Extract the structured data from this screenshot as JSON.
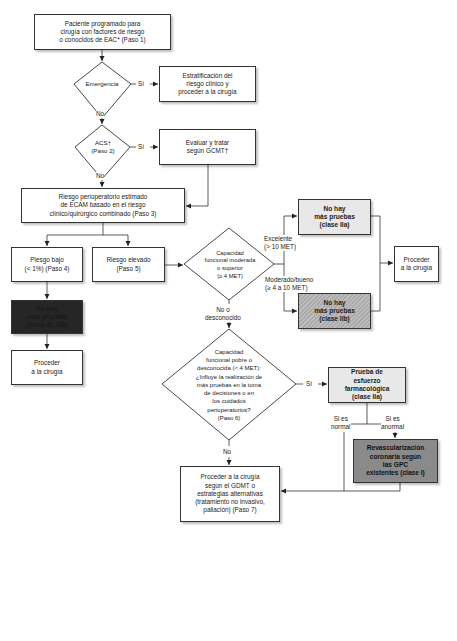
{
  "diagram": {
    "type": "flowchart",
    "language": "es",
    "nodes": {
      "step1": {
        "text": "Paciente programado para\ncirugía con factores de riesgo\no conocidos de EAC* (Paso 1)",
        "shape": "box"
      },
      "emergencia": {
        "text": "Emergencia",
        "shape": "diamond"
      },
      "estratificacion": {
        "text": "Estratificación del\nriesgo clínico y\nproceder a la cirugía",
        "shape": "box"
      },
      "acs": {
        "text": "ACS†\n(Paso 2)",
        "shape": "diamond"
      },
      "evaluar": {
        "text": "Evaluar y tratar\nsegún GCMT†",
        "shape": "box"
      },
      "step3": {
        "text": "Riesgo perioperatorio estimado\nde ECAM basado en el riesgo\nclínico/quirúrgico combinado (Paso 3)",
        "shape": "box"
      },
      "riesgo_bajo": {
        "text": "Piesgo bajo\n(< 1%) (Paso 4)",
        "shape": "box"
      },
      "riesgo_elevado": {
        "text": "Riesgo elevado\n(Paso 5)",
        "shape": "box"
      },
      "capacidad": {
        "text": "Capacidad\nfuncional moderada\no superior\n(≥ 4 MET)",
        "shape": "diamond"
      },
      "no_pruebas_IIa": {
        "text": "No hay\nmás pruebas\n(clase IIa)",
        "shape": "box",
        "fill": "#e8e8e8"
      },
      "no_pruebas_IIb": {
        "text": "No hay\nmás pruebas\n(clase IIb)",
        "shape": "box",
        "fill": "hatched-gray"
      },
      "proceder_right": {
        "text": "Proceder\na la cirugía",
        "shape": "box"
      },
      "no_pruebas_III": {
        "text": "No hay\nmás pruebas\n(clase III: NB)",
        "shape": "box",
        "fill": "#262626"
      },
      "proceder_left": {
        "text": "Proceder\na la cirugía",
        "shape": "box"
      },
      "capacidad_pobre": {
        "text": "Capacidad\nfuncional pobre o\ndesconocida (< 4 MET):\n¿Influye la realización de\nmás pruebas en la toma\nde decisiones o en\nlos cuidados\nperioperatorios?\n(Paso 6)",
        "shape": "diamond"
      },
      "prueba_esfuerzo": {
        "text": "Prueba de\nesfuerzo\nfarmacológica\n(clase IIa)",
        "shape": "box",
        "fill": "#e8e8e8"
      },
      "revascularizacion": {
        "text": "Revascularización\ncoronaria según\nlas GPC\nexistentes (clase I)",
        "shape": "box",
        "fill": "#8a8a8a"
      },
      "step7": {
        "text": "Proceder a la cirugía\nsegún el GDMT o\nestrategias alternativas\n(tratamiento no invasivo,\npaliación) (Paso 7)",
        "shape": "box"
      }
    },
    "edge_labels": {
      "emergencia_si": "Sí",
      "emergencia_no": "No",
      "acs_si": "Sí",
      "acs_no": "No",
      "excelente": "Excelente\n(> 10 MET)",
      "moderado": "Moderado/bueno\n(≥ 4 a 10 MET)",
      "no_desconocido": "No o\ndesconocido",
      "paso6_si": "Sí",
      "paso6_no": "No",
      "si_normal": "Si es\nnormal",
      "si_anormal": "Si es\nanormal"
    },
    "edges": [
      {
        "from": "step1",
        "to": "emergencia"
      },
      {
        "from": "emergencia",
        "to": "estratificacion",
        "label": "Sí"
      },
      {
        "from": "emergencia",
        "to": "acs",
        "label": "No"
      },
      {
        "from": "acs",
        "to": "evaluar",
        "label": "Sí"
      },
      {
        "from": "acs",
        "to": "step3",
        "label": "No"
      },
      {
        "from": "evaluar",
        "to": "step3"
      },
      {
        "from": "step3",
        "to": "riesgo_bajo"
      },
      {
        "from": "step3",
        "to": "riesgo_elevado"
      },
      {
        "from": "riesgo_bajo",
        "to": "no_pruebas_III"
      },
      {
        "from": "no_pruebas_III",
        "to": "proceder_left"
      },
      {
        "from": "riesgo_elevado",
        "to": "capacidad"
      },
      {
        "from": "capacidad",
        "to": "no_pruebas_IIa",
        "label": "Excelente (> 10 MET)"
      },
      {
        "from": "capacidad",
        "to": "no_pruebas_IIb",
        "label": "Moderado/bueno (≥ 4 a 10 MET)"
      },
      {
        "from": "no_pruebas_IIa",
        "to": "proceder_right"
      },
      {
        "from": "no_pruebas_IIb",
        "to": "proceder_right"
      },
      {
        "from": "capacidad",
        "to": "capacidad_pobre",
        "label": "No o desconocido"
      },
      {
        "from": "capacidad_pobre",
        "to": "prueba_esfuerzo",
        "label": "Sí"
      },
      {
        "from": "capacidad_pobre",
        "to": "step7",
        "label": "No"
      },
      {
        "from": "prueba_esfuerzo",
        "to": "revascularizacion",
        "label": "Si es anormal"
      },
      {
        "from": "prueba_esfuerzo",
        "to": "step7",
        "label": "Si es normal"
      },
      {
        "from": "revascularizacion",
        "to": "step7"
      }
    ]
  }
}
